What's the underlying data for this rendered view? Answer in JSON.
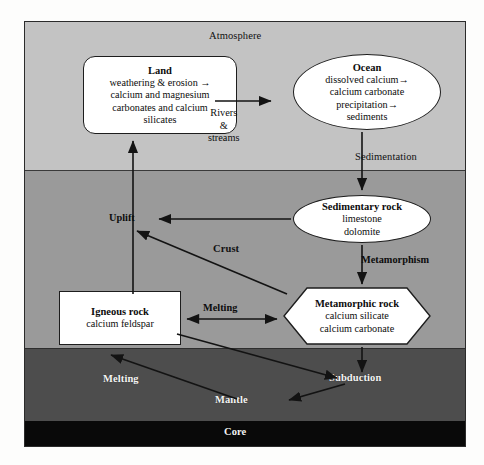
{
  "diagram": {
    "layers": [
      {
        "id": "atmosphere",
        "label": "Atmosphere",
        "color": "#c3c3c3"
      },
      {
        "id": "crust",
        "label": "Crust",
        "color": "#9a9a9a"
      },
      {
        "id": "mantle",
        "label": "Mantle",
        "color": "#4d4d4d"
      },
      {
        "id": "core",
        "label": "Core",
        "color": "#090909"
      }
    ],
    "nodes": [
      {
        "id": "land",
        "shape": "rounded-rect",
        "title": "Land",
        "lines": [
          "weathering & erosion →",
          "calcium and magnesium",
          "carbonates and calcium",
          "silicates"
        ]
      },
      {
        "id": "ocean",
        "shape": "ellipse",
        "title": "Ocean",
        "lines": [
          "dissolved calcium→",
          "calcium carbonate",
          "precipitation→",
          "sediments"
        ]
      },
      {
        "id": "sedimentary_rock",
        "shape": "ellipse",
        "title": "Sedimentary rock",
        "lines": [
          "limestone",
          "dolomite"
        ]
      },
      {
        "id": "igneous_rock",
        "shape": "rect",
        "title": "Igneous rock",
        "lines": [
          "calcium feldspar"
        ]
      },
      {
        "id": "metamorphic_rock",
        "shape": "hexagon",
        "title": "Metamorphic rock",
        "lines": [
          "calcium silicate",
          "calcium carbonate"
        ]
      }
    ],
    "edge_labels": {
      "rivers_line1": "Rivers",
      "rivers_line2": "&",
      "rivers_line3": "streams",
      "sedimentation": "Sedimentation",
      "uplift": "Uplift",
      "metamorphism": "Metamorphism",
      "melting_crust": "Melting",
      "melting_mantle": "Melting",
      "subduction": "Subduction"
    },
    "colors": {
      "atmosphere": "#c3c3c3",
      "crust": "#9a9a9a",
      "mantle": "#4d4d4d",
      "core": "#090909",
      "node_fill": "#ffffff",
      "stroke": "#1d1d1d",
      "light_text": "#f4f4f4"
    }
  }
}
